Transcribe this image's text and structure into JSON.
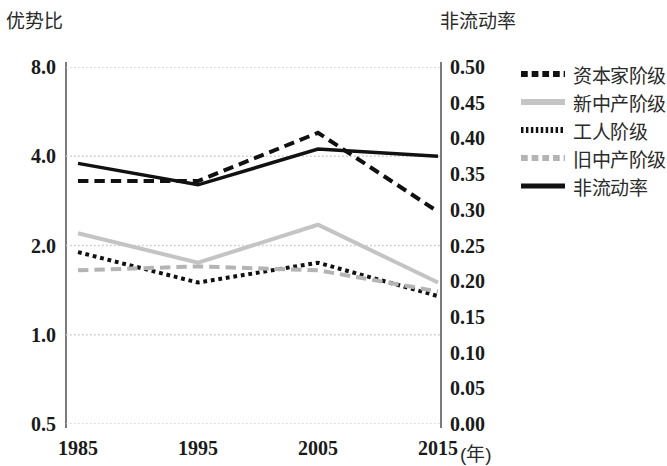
{
  "chart_data": {
    "type": "line",
    "title": "",
    "xlabel": "(年)",
    "x": [
      "1985",
      "1995",
      "2005",
      "2015"
    ],
    "categories": [
      "1985",
      "1995",
      "2005",
      "2015"
    ],
    "left_axis": {
      "label": "优势比",
      "scale": "log",
      "ticks": [
        "8.0",
        "4.0",
        "2.0",
        "1.0",
        "0.5"
      ],
      "tick_values": [
        8.0,
        4.0,
        2.0,
        1.0,
        0.5
      ],
      "ylim": [
        0.5,
        8.0
      ]
    },
    "right_axis": {
      "label": "非流动率",
      "scale": "linear",
      "ticks": [
        "0.50",
        "0.45",
        "0.40",
        "0.35",
        "0.30",
        "0.25",
        "0.20",
        "0.15",
        "0.10",
        "0.05",
        "0.00"
      ],
      "tick_values": [
        0.5,
        0.45,
        0.4,
        0.35,
        0.3,
        0.25,
        0.2,
        0.15,
        0.1,
        0.05,
        0.0
      ],
      "ylim": [
        0.0,
        0.5
      ]
    },
    "grid": true,
    "gridlines_at": [
      8.0,
      4.0,
      2.0,
      1.0,
      0.5
    ],
    "legend_position": "right",
    "series": [
      {
        "name": "资本家阶级",
        "axis": "left",
        "values": [
          3.3,
          3.3,
          4.8,
          2.6
        ],
        "style": "dashed",
        "color": "#111111",
        "width": 4
      },
      {
        "name": "新中产阶级",
        "axis": "left",
        "values": [
          2.2,
          1.75,
          2.35,
          1.5
        ],
        "style": "solid",
        "color": "#c4c4c4",
        "width": 4
      },
      {
        "name": "工人阶级",
        "axis": "left",
        "values": [
          1.9,
          1.5,
          1.75,
          1.35
        ],
        "style": "dotted",
        "color": "#111111",
        "width": 4
      },
      {
        "name": "旧中产阶级",
        "axis": "left",
        "values": [
          1.65,
          1.7,
          1.65,
          1.4
        ],
        "style": "dashed",
        "color": "#b4b4b4",
        "width": 4
      },
      {
        "name": "非流动率",
        "axis": "right",
        "values": [
          0.365,
          0.335,
          0.385,
          0.375
        ],
        "style": "solid",
        "color": "#111111",
        "width": 3.5
      }
    ]
  },
  "legend": {
    "items": [
      {
        "label": "资本家阶级",
        "swatch": "legend-swatch-capitalist"
      },
      {
        "label": "新中产阶级",
        "swatch": "legend-swatch-new-middle"
      },
      {
        "label": "工人阶级",
        "swatch": "legend-swatch-worker"
      },
      {
        "label": "旧中产阶级",
        "swatch": "legend-swatch-old-middle"
      },
      {
        "label": "非流动率",
        "swatch": "legend-swatch-immobility"
      }
    ]
  }
}
